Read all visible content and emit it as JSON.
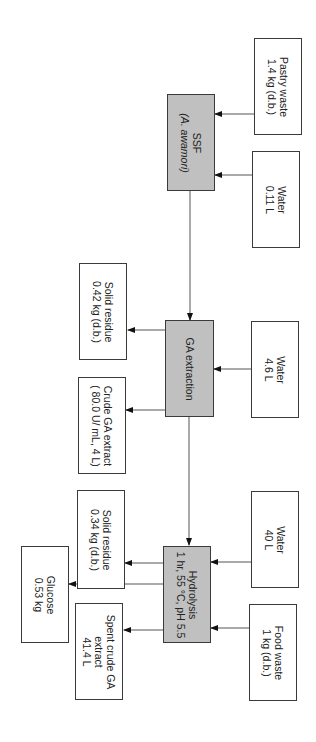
{
  "diagram": {
    "orientation": "rotated 90deg clockwise (flow top-to-bottom)",
    "colors": {
      "process_fill": "#c0c0c0",
      "stream_fill": "#ffffff",
      "line": "#3a3a3a"
    },
    "process_units": [
      {
        "id": "ssf",
        "lines": [
          "SSF",
          "(A. awamori)"
        ]
      },
      {
        "id": "ga_extraction",
        "lines": [
          "GA extraction"
        ]
      },
      {
        "id": "hydrolysis",
        "lines": [
          "Hydrolysis",
          "1 hr, 55 °C, pH 5.5"
        ]
      }
    ],
    "inputs": [
      {
        "id": "pastry_waste",
        "to": "ssf",
        "lines": [
          "Pastry waste",
          "1.4 kg (d.b.)"
        ]
      },
      {
        "id": "water_ssf",
        "to": "ssf",
        "lines": [
          "Water",
          "0.11 L"
        ]
      },
      {
        "id": "water_ext",
        "to": "ga_extraction",
        "lines": [
          "Water",
          "4.6 L"
        ]
      },
      {
        "id": "water_hyd",
        "to": "hydrolysis",
        "lines": [
          "Water",
          "40 L"
        ]
      },
      {
        "id": "food_waste",
        "to": "hydrolysis",
        "lines": [
          "Food waste",
          "1 kg (d.b.)"
        ]
      }
    ],
    "outputs": [
      {
        "id": "solid_residue_1",
        "from": "ga_extraction",
        "lines": [
          "Solid residue",
          "0.42 kg (d.b.)"
        ]
      },
      {
        "id": "crude_ga",
        "from": "ga_extraction",
        "lines": [
          "Crude GA extract",
          "( 80.0 U/ mL, 4 L)"
        ]
      },
      {
        "id": "solid_residue_2",
        "from": "hydrolysis",
        "lines": [
          "Solid residue",
          "0.34 kg (d.b.)"
        ]
      },
      {
        "id": "glucose",
        "from": "hydrolysis",
        "lines": [
          "Glucose",
          "0.53 kg"
        ]
      },
      {
        "id": "spent_crude",
        "from": "hydrolysis",
        "lines": [
          "Spent crude GA",
          "extract",
          "41.4 L"
        ]
      }
    ]
  }
}
